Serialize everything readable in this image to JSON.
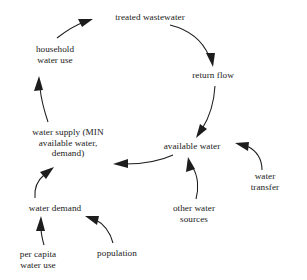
{
  "diagram": {
    "background_color": "#ffffff",
    "stroke_color": "#1d1d1d",
    "text_color": "#1a1a1a",
    "nodes": [
      {
        "id": "treated-wastewater",
        "label": "treated wastewater",
        "x": 150,
        "y": 17
      },
      {
        "id": "household-water-use",
        "label": "household\nwater use",
        "x": 55,
        "y": 55
      },
      {
        "id": "return-flow",
        "label": "return flow",
        "x": 213,
        "y": 75
      },
      {
        "id": "water-supply",
        "label": "water supply (MIN\navailable water,\ndemand)",
        "x": 68,
        "y": 143
      },
      {
        "id": "available-water",
        "label": "available water",
        "x": 192,
        "y": 146
      },
      {
        "id": "water-transfer",
        "label": "water transfer",
        "x": 265,
        "y": 182
      },
      {
        "id": "other-water-sources",
        "label": "other water\nsources",
        "x": 194,
        "y": 214
      },
      {
        "id": "water-demand",
        "label": "water demand",
        "x": 55,
        "y": 208
      },
      {
        "id": "per-capita-water-use",
        "label": "per capita\nwater use",
        "x": 38,
        "y": 260
      },
      {
        "id": "population",
        "label": "population",
        "x": 117,
        "y": 253
      }
    ],
    "edges": [
      {
        "id": "household-to-treated",
        "from": "household-water-use",
        "to": "treated wastewater"
      },
      {
        "id": "treated-to-return-flow",
        "from": "treated wastewater",
        "to": "return flow"
      },
      {
        "id": "return-flow-to-available",
        "from": "return flow",
        "to": "available water"
      },
      {
        "id": "available-to-supply",
        "from": "available water",
        "to": "water supply"
      },
      {
        "id": "supply-to-household",
        "from": "water supply",
        "to": "household water use"
      },
      {
        "id": "demand-to-supply",
        "from": "water demand",
        "to": "water supply"
      },
      {
        "id": "per-capita-to-demand",
        "from": "per capita water use",
        "to": "water demand"
      },
      {
        "id": "population-to-demand",
        "from": "population",
        "to": "water demand"
      },
      {
        "id": "other-sources-to-available",
        "from": "other water sources",
        "to": "available water"
      },
      {
        "id": "transfer-to-available",
        "from": "water transfer",
        "to": "available water"
      }
    ]
  }
}
